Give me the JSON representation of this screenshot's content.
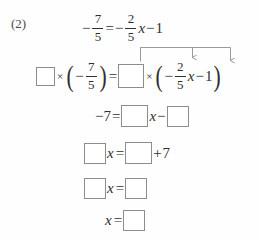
{
  "problem": {
    "label": "(2)",
    "symbols": {
      "minus": "−",
      "equals": "=",
      "times": "×",
      "plus": "+",
      "x": "x",
      "lparen": "(",
      "rparen": ")"
    },
    "lines": [
      {
        "id": "line-1-original-equation",
        "description": "original equation",
        "text": "-7/5 = -2/5 x - 1",
        "left": {
          "fraction": {
            "numerator": "7",
            "denominator": "5"
          },
          "sign": "−"
        },
        "right": {
          "coefficient": {
            "numerator": "2",
            "denominator": "5"
          },
          "sign": "−",
          "variable": "x",
          "constant": "1",
          "constant_sign": "−"
        }
      },
      {
        "id": "line-2-multiply-both-sides",
        "description": "multiply both sides by a blank",
        "text": "□ × ( -7/5 ) = □ × ( -2/5 x - 1 )",
        "left_box": "",
        "left_fraction": {
          "numerator": "7",
          "denominator": "5"
        },
        "right_box": "",
        "right_fraction": {
          "numerator": "2",
          "denominator": "5"
        },
        "right_variable": "x",
        "right_constant": "1"
      },
      {
        "id": "line-3-expanded",
        "description": "expanded result",
        "text": "-7 = □ x - □",
        "lhs": "−7",
        "box_coefficient": "",
        "variable": "x",
        "box_constant": ""
      },
      {
        "id": "line-4-move-constant",
        "description": "move constant to right side",
        "text": "□ x = □ + 7",
        "box_coefficient": "",
        "variable": "x",
        "box_value": "",
        "addend": "7"
      },
      {
        "id": "line-5-simplified",
        "description": "simplified",
        "text": "□ x = □",
        "box_coefficient": "",
        "variable": "x",
        "box_value": ""
      },
      {
        "id": "line-6-solution",
        "description": "final solution",
        "text": "x = □",
        "variable": "x",
        "box_value": ""
      }
    ],
    "annotation": {
      "type": "distribution-arrows",
      "description": "arrows from the blank box over to the 2/5 x term and to the 1 term",
      "arrow_count": 2,
      "color": "#9a9a9a"
    }
  },
  "ghost_text": {
    "line_a": "",
    "line_b": "",
    "line_c": ""
  },
  "colors": {
    "ink": "#2e2e2e",
    "box_border": "#8d8d8d",
    "arrow": "#9a9a9a",
    "page": "#fefefe"
  }
}
